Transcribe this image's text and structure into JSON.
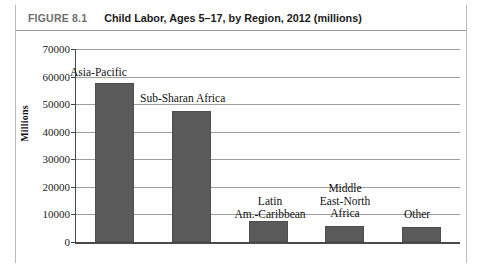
{
  "figure": {
    "number": "FIGURE 8.1",
    "title": "Child Labor, Ages 5–17, by Region, 2012 (millions)"
  },
  "chart_data": {
    "type": "bar",
    "title": "Child Labor, Ages 5–17, by Region, 2012 (millions)",
    "xlabel": "",
    "ylabel": "Millions",
    "ylim": [
      0,
      70000
    ],
    "ytick_step": 10000,
    "grid": true,
    "legend": "none",
    "bar_color": "#5a5a5a",
    "categories": [
      "Asia-Pacific",
      "Sub-Sharan Africa",
      "Latin\nAm.-Caribbean",
      "Middle\nEast-North\nAfrica",
      "Other"
    ],
    "values": [
      57600,
      47500,
      7600,
      5800,
      5400
    ],
    "ticklabels": [
      "0",
      "10000",
      "20000",
      "30000",
      "40000",
      "50000",
      "60000",
      "70000"
    ]
  }
}
